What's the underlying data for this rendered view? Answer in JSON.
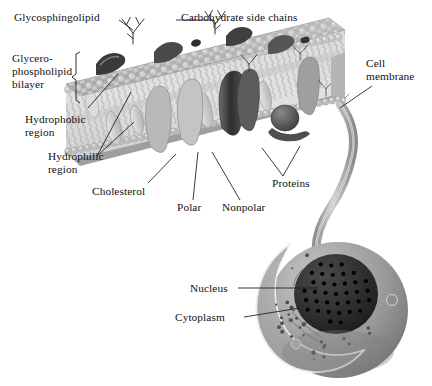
{
  "diagram": {
    "background_color": "#ffffff",
    "ink_color": "#111111",
    "style": "grayscale airbrushed biology illustration, serif labels with thin leader lines"
  },
  "labels": {
    "glycosphingolipid": "Glycosphingolipid",
    "carbohydrate_side_chains": "Carbohydrate side chains",
    "glycerophospholipid_bilayer_line1": "Glycero-",
    "glycerophospholipid_bilayer_line2": "phospholipid",
    "glycerophospholipid_bilayer_line3": "bilayer",
    "hydrophobic_region_line1": "Hydrophobic",
    "hydrophobic_region_line2": "region",
    "hydrophilic_region_line1": "Hydrophilic",
    "hydrophilic_region_line2": "region",
    "cholesterol": "Cholesterol",
    "polar": "Polar",
    "nonpolar": "Nonpolar",
    "proteins": "Proteins",
    "cell_membrane_line1": "Cell",
    "cell_membrane_line2": "membrane",
    "nucleus": "Nucleus",
    "cytoplasm": "Cytoplasm"
  },
  "structures": {
    "membrane_slab": "phospholipid bilayer slab shown in 3D cutaway",
    "lipid_head_groups": "spherical polar head groups on both membrane faces",
    "lipid_tails": "zigzag nonpolar hydrocarbon tails in membrane interior",
    "integral_proteins": "dark embedded transmembrane protein shapes",
    "peripheral_protein": "disc-shaped protein on membrane surface",
    "cholesterol_molecules": "pale elongated molecules wedged between lipids",
    "carbohydrate_trees": "branched glycan chains on outer membrane face",
    "connector_ribbon": "curving ribbon linking membrane patch to whole cell",
    "cell_body": "spherical cell with cutaway wedge",
    "nucleus_body": "dark sphere with nuclear pores",
    "cytoplasm_region": "granular gray interior of the cutaway"
  },
  "colors": {
    "membrane_top_face": "#b3b3b3",
    "membrane_heads": "#c9c9c9",
    "membrane_interior": "#d7d7d7",
    "protein_dark": "#3d3d3d",
    "protein_mid": "#6f6f6f",
    "cholesterol": "#cfcfcf",
    "cell_outer": "#9a9a9a",
    "cytoplasm": "#a8a8a8",
    "nucleus": "#2a2a2a",
    "nuclear_pore": "#000000",
    "leader_line": "#1a1a1a"
  }
}
